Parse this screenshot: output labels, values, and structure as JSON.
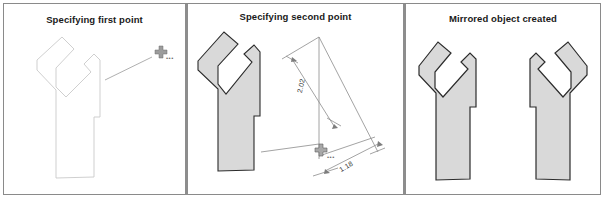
{
  "figure": {
    "panel_count": 3,
    "background_color": "#ffffff",
    "border_color": "#8a8a8a",
    "divider_color": "#8d8d8d",
    "shape_fill_color": "#d9d9d9",
    "shape_outline_color": "#2b2b2b",
    "outline_only_color": "#c9c9c9",
    "geometry_line_color": "#8c8c8c"
  },
  "panels": [
    {
      "id": "panel-specifying-first-point",
      "title": "Specifying first point",
      "shape": {
        "name": "y-shaped-object",
        "style": "outline",
        "fill": "none",
        "stroke": "#c9c9c9"
      },
      "cursor": {
        "name": "crosshair-cursor",
        "glyph": "+",
        "trail_dots": "•••"
      },
      "rubber_band_line": true
    },
    {
      "id": "panel-specifying-second-point",
      "title": "Specifying second point",
      "shape": {
        "name": "y-shaped-object",
        "style": "filled",
        "fill": "#d9d9d9",
        "stroke": "#2b2b2b"
      },
      "cursor": {
        "name": "crosshair-cursor",
        "glyph": "+",
        "trail_dots": "•••"
      },
      "dimensions": [
        {
          "name": "vertical-dimension",
          "value": "2.02"
        },
        {
          "name": "angled-dimension",
          "value": "1.18"
        }
      ]
    },
    {
      "id": "panel-mirrored-object-created",
      "title": "Mirrored object created",
      "shapes": [
        {
          "name": "original-y-object",
          "style": "filled",
          "fill": "#d9d9d9",
          "stroke": "#2b2b2b",
          "mirrored": false
        },
        {
          "name": "mirrored-y-object",
          "style": "filled",
          "fill": "#d9d9d9",
          "stroke": "#2b2b2b",
          "mirrored": true
        }
      ]
    }
  ]
}
